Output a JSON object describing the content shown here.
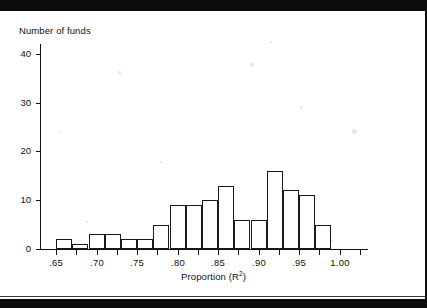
{
  "figure": {
    "y_axis_title": "Number of funds",
    "x_axis_title_prefix": "Proportion (R",
    "x_axis_title_sup": "2",
    "x_axis_title_suffix": ")"
  },
  "chart_data": {
    "type": "bar",
    "title": "",
    "subtitle": "",
    "xlabel": "Proportion (R2)",
    "ylabel": "Number of funds",
    "grid": false,
    "legend": null,
    "xlim": [
      0.63,
      1.035
    ],
    "ylim": [
      0,
      42
    ],
    "bin_width": 0.02,
    "x_tick_values": [
      0.65,
      0.7,
      0.75,
      0.8,
      0.85,
      0.9,
      0.95,
      1.0
    ],
    "x_tick_labels": [
      ".65",
      ".70",
      ".75",
      ".80",
      ".85",
      ".90",
      ".95",
      "1.00"
    ],
    "x_minor_tick_values": [
      0.675,
      0.725,
      0.775,
      0.825,
      0.875,
      0.925,
      0.975,
      1.025
    ],
    "y_tick_values": [
      0,
      10,
      20,
      30,
      40
    ],
    "y_tick_labels": [
      "0",
      "10",
      "20",
      "30",
      "40"
    ],
    "categories": [
      "0.65-0.67",
      "0.67-0.69",
      "0.69-0.71",
      "0.71-0.73",
      "0.73-0.75",
      "0.75-0.77",
      "0.77-0.79",
      "0.79-0.81",
      "0.81-0.83",
      "0.83-0.85",
      "0.85-0.87",
      "0.87-0.89",
      "0.89-0.91",
      "0.91-0.93",
      "0.93-0.95",
      "0.95-0.97",
      "0.97-0.99"
    ],
    "bins": [
      {
        "left": 0.65,
        "right": 0.67,
        "value": 2
      },
      {
        "left": 0.67,
        "right": 0.69,
        "value": 1
      },
      {
        "left": 0.69,
        "right": 0.71,
        "value": 3
      },
      {
        "left": 0.71,
        "right": 0.73,
        "value": 3
      },
      {
        "left": 0.73,
        "right": 0.75,
        "value": 2
      },
      {
        "left": 0.75,
        "right": 0.77,
        "value": 2
      },
      {
        "left": 0.77,
        "right": 0.79,
        "value": 5
      },
      {
        "left": 0.79,
        "right": 0.81,
        "value": 9
      },
      {
        "left": 0.81,
        "right": 0.83,
        "value": 9
      },
      {
        "left": 0.83,
        "right": 0.85,
        "value": 10
      },
      {
        "left": 0.85,
        "right": 0.87,
        "value": 13
      },
      {
        "left": 0.87,
        "right": 0.89,
        "value": 6
      },
      {
        "left": 0.89,
        "right": 0.91,
        "value": 6
      },
      {
        "left": 0.91,
        "right": 0.93,
        "value": 16
      },
      {
        "left": 0.93,
        "right": 0.95,
        "value": 12
      },
      {
        "left": 0.95,
        "right": 0.97,
        "value": 11
      },
      {
        "left": 0.97,
        "right": 0.99,
        "value": 5
      }
    ],
    "values": [
      2,
      1,
      3,
      3,
      2,
      2,
      5,
      9,
      9,
      10,
      13,
      6,
      6,
      16,
      12,
      11,
      5
    ]
  },
  "colors": {
    "band": "#0d0d0d",
    "axis": "#111111",
    "bar_stroke": "#1a1a1a",
    "bar_fill": "#ffffff",
    "page": "#ffffff"
  }
}
